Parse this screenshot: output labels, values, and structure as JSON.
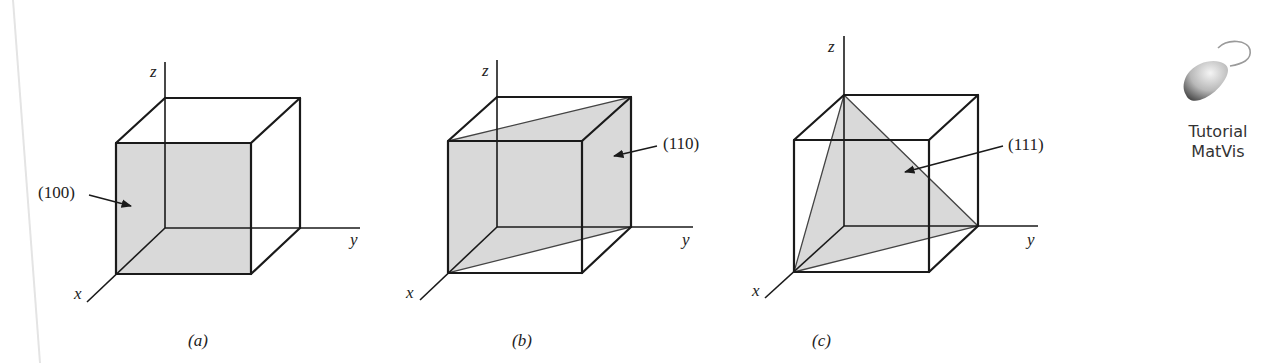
{
  "figure": {
    "colors": {
      "background": "#ffffff",
      "edge": "#1a1a1a",
      "plane_fill": "#d9d9d9",
      "text": "#222222"
    },
    "panels": [
      {
        "id": "a",
        "caption": "(a)",
        "plane_label": "(100)",
        "axis_labels": {
          "x": "x",
          "y": "y",
          "z": "z"
        }
      },
      {
        "id": "b",
        "caption": "(b)",
        "plane_label": "(110)",
        "axis_labels": {
          "x": "x",
          "y": "y",
          "z": "z"
        }
      },
      {
        "id": "c",
        "caption": "(c)",
        "plane_label": "(111)",
        "axis_labels": {
          "x": "x",
          "y": "y",
          "z": "z"
        }
      }
    ]
  },
  "sidebar": {
    "icon": "mouse-icon",
    "line1": "Tutorial",
    "line2": "MatVis"
  }
}
